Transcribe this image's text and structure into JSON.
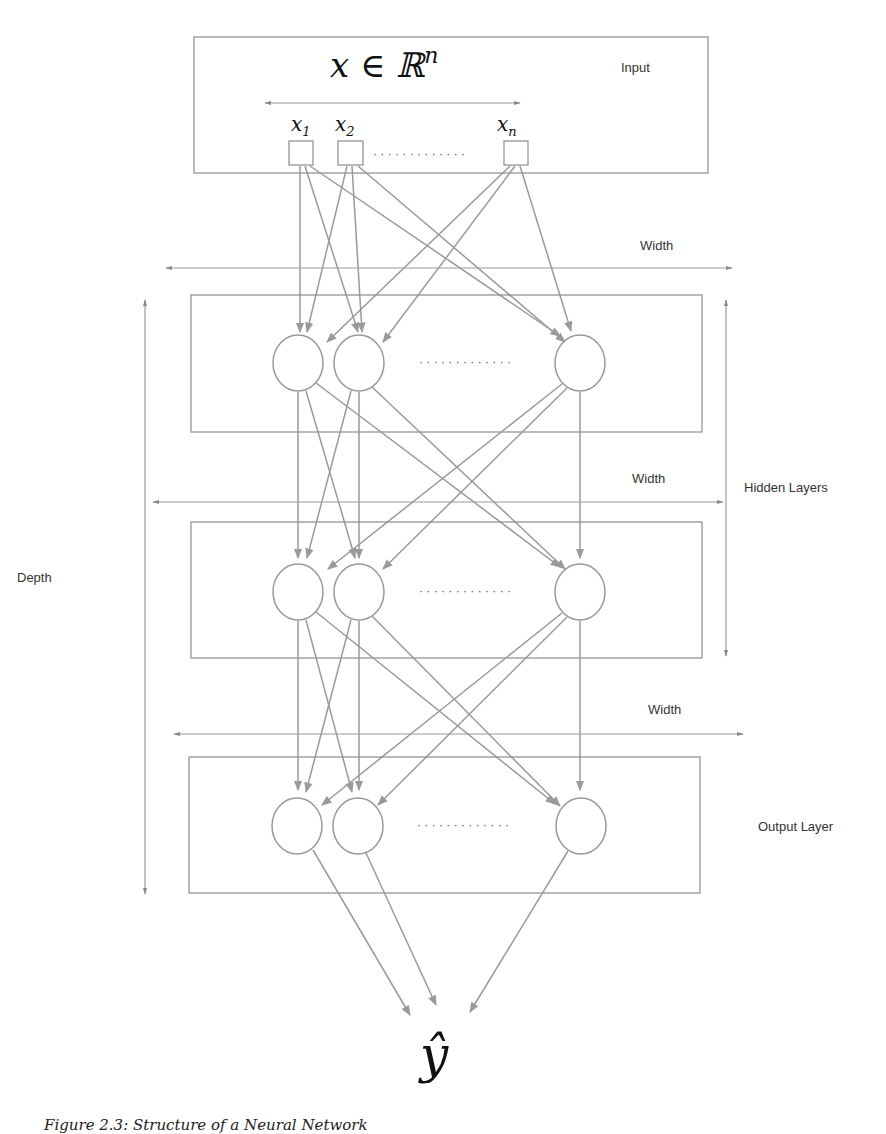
{
  "diagram": {
    "title_math": "x ∈ ℝ",
    "title_sup": "n",
    "input_label": "Input",
    "inputs": [
      {
        "base": "x",
        "sub": "1"
      },
      {
        "base": "x",
        "sub": "2"
      },
      {
        "base": "x",
        "sub": "n"
      }
    ],
    "width_labels": [
      "Width",
      "Width",
      "Width"
    ],
    "depth_label": "Depth",
    "hidden_layers_label": "Hidden Layers",
    "output_layer_label": "Output Layer",
    "output_math": "ŷ",
    "ellipsis": "· · · · · · · · · · · · ·",
    "colors": {
      "stroke": "#9a9a9a",
      "box": "#8c8c8c",
      "text": "#333333"
    }
  },
  "caption": "Figure 2.3: Structure of a Neural Network"
}
